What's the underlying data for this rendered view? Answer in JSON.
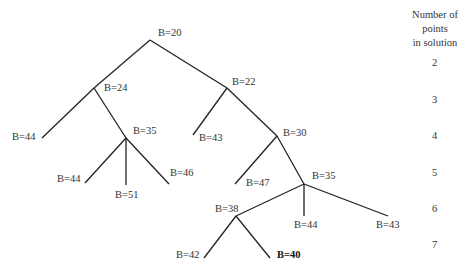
{
  "header": {
    "line1": "Number of points",
    "line2": "in solution"
  },
  "levels": [
    "2",
    "3",
    "4",
    "5",
    "6",
    "7"
  ],
  "nodes": {
    "root": "B=20",
    "n24": "B=24",
    "n22": "B=22",
    "n44a": "B=44",
    "n35a": "B=35",
    "n43a": "B=43",
    "n30": "B=30",
    "n44b": "B=44",
    "n51": "B=51",
    "n46": "B=46",
    "n47": "B=47",
    "n35b": "B=35",
    "n38": "B=38",
    "n44c": "B=44",
    "n43b": "B=43",
    "n42": "B=42",
    "n40": "B=40"
  },
  "highlight_node": "B=40"
}
